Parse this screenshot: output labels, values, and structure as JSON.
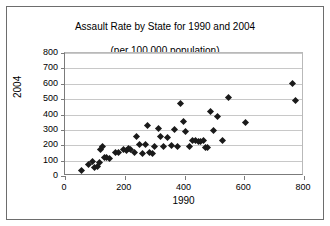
{
  "chart_data": {
    "type": "scatter",
    "title": "Assault Rate by State for 1990 and 2004\n(per 100,000 population)",
    "title_line1": "Assault Rate by State for 1990 and 2004",
    "title_line2": "(per 100,000 population)",
    "xlabel": "1990",
    "ylabel": "2004",
    "xlim": [
      0,
      800
    ],
    "ylim": [
      0,
      800
    ],
    "xticks": [
      0,
      200,
      400,
      600,
      800
    ],
    "yticks": [
      0,
      100,
      200,
      300,
      400,
      500,
      600,
      700,
      800
    ],
    "grid": "horizontal",
    "legend": "none",
    "marker": "diamond",
    "marker_color": "#1a1a1a",
    "points": [
      {
        "x": 55,
        "y": 35
      },
      {
        "x": 78,
        "y": 75
      },
      {
        "x": 92,
        "y": 95
      },
      {
        "x": 100,
        "y": 58
      },
      {
        "x": 108,
        "y": 62
      },
      {
        "x": 115,
        "y": 88
      },
      {
        "x": 120,
        "y": 175
      },
      {
        "x": 124,
        "y": 190
      },
      {
        "x": 132,
        "y": 120
      },
      {
        "x": 140,
        "y": 118
      },
      {
        "x": 150,
        "y": 112
      },
      {
        "x": 168,
        "y": 155
      },
      {
        "x": 180,
        "y": 152
      },
      {
        "x": 196,
        "y": 170
      },
      {
        "x": 205,
        "y": 168
      },
      {
        "x": 212,
        "y": 178
      },
      {
        "x": 220,
        "y": 175
      },
      {
        "x": 232,
        "y": 150
      },
      {
        "x": 240,
        "y": 255
      },
      {
        "x": 250,
        "y": 205
      },
      {
        "x": 258,
        "y": 148
      },
      {
        "x": 268,
        "y": 205
      },
      {
        "x": 275,
        "y": 330
      },
      {
        "x": 284,
        "y": 150
      },
      {
        "x": 292,
        "y": 148
      },
      {
        "x": 300,
        "y": 192
      },
      {
        "x": 312,
        "y": 310
      },
      {
        "x": 320,
        "y": 255
      },
      {
        "x": 330,
        "y": 195
      },
      {
        "x": 342,
        "y": 250
      },
      {
        "x": 356,
        "y": 198
      },
      {
        "x": 368,
        "y": 300
      },
      {
        "x": 378,
        "y": 195
      },
      {
        "x": 388,
        "y": 470
      },
      {
        "x": 398,
        "y": 355
      },
      {
        "x": 405,
        "y": 288
      },
      {
        "x": 418,
        "y": 192
      },
      {
        "x": 428,
        "y": 230
      },
      {
        "x": 438,
        "y": 228
      },
      {
        "x": 446,
        "y": 225
      },
      {
        "x": 452,
        "y": 225
      },
      {
        "x": 462,
        "y": 230
      },
      {
        "x": 470,
        "y": 185
      },
      {
        "x": 478,
        "y": 185
      },
      {
        "x": 486,
        "y": 420
      },
      {
        "x": 496,
        "y": 298
      },
      {
        "x": 512,
        "y": 388
      },
      {
        "x": 528,
        "y": 232
      },
      {
        "x": 548,
        "y": 508
      },
      {
        "x": 605,
        "y": 350
      },
      {
        "x": 762,
        "y": 602
      },
      {
        "x": 770,
        "y": 490
      }
    ]
  }
}
